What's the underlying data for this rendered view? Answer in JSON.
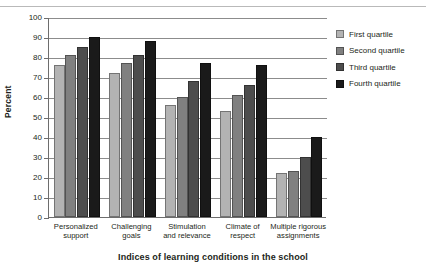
{
  "chart_data": {
    "type": "bar",
    "title": "",
    "xlabel": "Indices of learning conditions in the school",
    "ylabel": "Percent",
    "ylim": [
      0,
      100
    ],
    "ytick_step": 10,
    "yticks": [
      100,
      90,
      80,
      70,
      60,
      50,
      40,
      30,
      20,
      10,
      0
    ],
    "grid": true,
    "legend_position": "right",
    "categories": [
      "Personalized support",
      "Challenging goals",
      "Stimulation and relevance",
      "Climate of respect",
      "Multiple rigorous assignments"
    ],
    "category_lines": [
      [
        "Personalized",
        "support"
      ],
      [
        "Challenging",
        "goals"
      ],
      [
        "Stimulation",
        "and relevance"
      ],
      [
        "Climate of",
        "respect"
      ],
      [
        "Multiple rigorous",
        "assignments"
      ]
    ],
    "series": [
      {
        "name": "First quartile",
        "color": "#b3b3b3",
        "values": [
          76,
          72,
          56,
          53,
          22
        ]
      },
      {
        "name": "Second quartile",
        "color": "#808080",
        "values": [
          81,
          77,
          60,
          61,
          23
        ]
      },
      {
        "name": "Third quartile",
        "color": "#4d4d4d",
        "values": [
          85,
          81,
          68,
          66,
          30
        ]
      },
      {
        "name": "Fourth quartile",
        "color": "#1a1a1a",
        "values": [
          90,
          88,
          77,
          76,
          40
        ]
      }
    ]
  },
  "legend": {
    "items": [
      {
        "label": "First quartile"
      },
      {
        "label": "Second quartile"
      },
      {
        "label": "Third quartile"
      },
      {
        "label": "Fourth quartile"
      }
    ]
  }
}
